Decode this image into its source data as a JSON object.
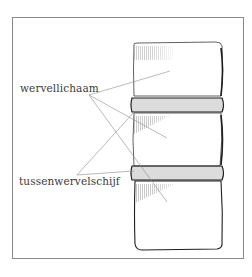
{
  "diagram": {
    "type": "anatomical-illustration",
    "labels": [
      {
        "id": "vertebral-body",
        "text": "wervellichaam"
      },
      {
        "id": "intervertebral-disc",
        "text": "tussenwervelschijf"
      }
    ],
    "colors": {
      "frame": "#8a8a8a",
      "outline": "#2a2a2a",
      "leader": "#8c8c8c",
      "hatch": "#9a9a9a",
      "text": "#3a3a3a"
    }
  }
}
